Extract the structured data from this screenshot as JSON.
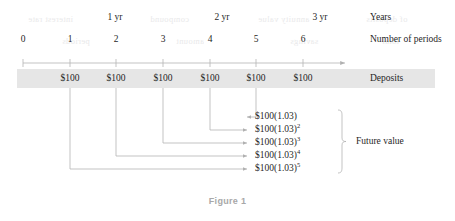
{
  "figure": {
    "caption": "Figure 1",
    "timeline": {
      "years": [
        {
          "label": "1 yr",
          "x": 115
        },
        {
          "label": "2 yr",
          "x": 222
        },
        {
          "label": "3 yr",
          "x": 320
        }
      ],
      "periods": [
        {
          "label": "0",
          "x": 23
        },
        {
          "label": "1",
          "x": 70
        },
        {
          "label": "2",
          "x": 116
        },
        {
          "label": "3",
          "x": 163
        },
        {
          "label": "4",
          "x": 210
        },
        {
          "label": "5",
          "x": 256
        },
        {
          "label": "6",
          "x": 303
        }
      ],
      "deposits": [
        {
          "label": "$100",
          "x": 70
        },
        {
          "label": "$100",
          "x": 116
        },
        {
          "label": "$100",
          "x": 163
        },
        {
          "label": "$100",
          "x": 210
        },
        {
          "label": "$100",
          "x": 256
        },
        {
          "label": "$100",
          "x": 303
        }
      ]
    },
    "row_labels": {
      "years": "Years",
      "periods": "Number of periods",
      "deposits": "Deposits",
      "future_value": "Future value"
    },
    "future_values": [
      {
        "base": "$100(1.03)",
        "exponent": ""
      },
      {
        "base": "$100(1.03)",
        "exponent": "2"
      },
      {
        "base": "$100(1.03)",
        "exponent": "3"
      },
      {
        "base": "$100(1.03)",
        "exponent": "4"
      },
      {
        "base": "$100(1.03)",
        "exponent": "5"
      }
    ],
    "ghost_text": [
      {
        "text": "interest rate",
        "x": 28,
        "y": 14
      },
      {
        "text": "compound",
        "x": 150,
        "y": 14
      },
      {
        "text": "annuity value",
        "x": 258,
        "y": 14
      },
      {
        "text": "of deposits",
        "x": 366,
        "y": 14
      },
      {
        "text": "periods",
        "x": 62,
        "y": 36
      },
      {
        "text": "amount",
        "x": 176,
        "y": 36
      },
      {
        "text": "savings",
        "x": 290,
        "y": 36
      },
      {
        "text": "total",
        "x": 382,
        "y": 36
      }
    ],
    "colors": {
      "band": "#e6e6e6",
      "line": "#b4b4b4",
      "text": "#1f1f1f",
      "caption": "#a8a8a8"
    }
  }
}
